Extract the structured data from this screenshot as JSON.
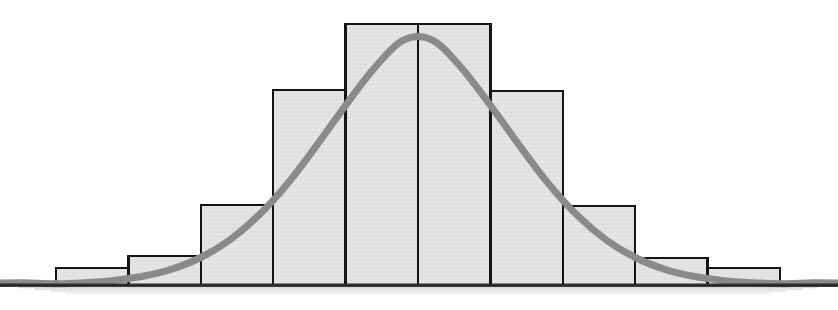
{
  "figure": {
    "name": "histogram-with-normal-curve",
    "width": 838,
    "height": 310,
    "background_color": "#ffffff"
  },
  "chart_data": {
    "type": "bar",
    "title": "",
    "subtitle": "",
    "xlabel": "",
    "ylabel": "",
    "grid": false,
    "legend": false,
    "legend_position": "none",
    "axis_ticks_visible": false,
    "tick_labels_visible": false,
    "categories": [
      "1",
      "2",
      "3",
      "4",
      "5",
      "6",
      "7",
      "8",
      "9",
      "10"
    ],
    "bin_edges": [
      -5,
      -4,
      -3,
      -2,
      -1,
      0,
      1,
      2,
      3,
      4,
      5
    ],
    "values": [
      6,
      11,
      31,
      75,
      100,
      100,
      75,
      31,
      11,
      6
    ],
    "xlim": [
      -5,
      5
    ],
    "ylim": [
      0,
      107
    ],
    "bar_fill_color": "#e2e2e2",
    "bar_edge_color": "#141414",
    "bar_edge_width": 2.5,
    "baseline_color": "#2b2b2b",
    "baseline_shadow_color": "#d9d9d9",
    "series": [
      {
        "name": "histogram",
        "type": "bar",
        "values": [
          6,
          11,
          31,
          75,
          100,
          100,
          75,
          31,
          11,
          6
        ]
      },
      {
        "name": "normal-curve",
        "type": "line",
        "color": "#8a8a8a",
        "line_width": 7,
        "peak_value": 107,
        "mean": 0,
        "std_dev": 1.52,
        "x": [
          -5.0,
          -4.6,
          -4.2,
          -3.8,
          -3.4,
          -3.0,
          -2.6,
          -2.2,
          -1.8,
          -1.4,
          -1.0,
          -0.6,
          -0.2,
          0.2,
          0.6,
          1.0,
          1.4,
          1.8,
          2.2,
          2.6,
          3.0,
          3.4,
          3.8,
          4.2,
          4.6,
          5.0
        ],
        "y": [
          0.5,
          0.9,
          1.8,
          3.4,
          6.2,
          10.7,
          17.5,
          27.1,
          39.5,
          54.3,
          69.9,
          84.5,
          95.3,
          95.3,
          84.5,
          69.9,
          54.3,
          39.5,
          27.1,
          17.5,
          10.7,
          6.2,
          3.4,
          1.8,
          0.9,
          0.5
        ]
      }
    ]
  },
  "geometry": {
    "plot_left": 56,
    "plot_right": 780,
    "baseline_y": 285,
    "bar_width": 72.4,
    "bar_edges_px": [
      56,
      128.4,
      200.8,
      273.2,
      345.6,
      418,
      490.4,
      562.8,
      635.2,
      707.6,
      780
    ],
    "bar_tops_px": [
      268,
      256,
      205,
      90,
      24,
      24,
      91,
      206,
      258,
      268
    ],
    "curve_peak_px": {
      "x": 418,
      "y": 10
    },
    "shadow_left": 18,
    "shadow_right": 818,
    "shadow_top": 286,
    "shadow_height": 8
  }
}
